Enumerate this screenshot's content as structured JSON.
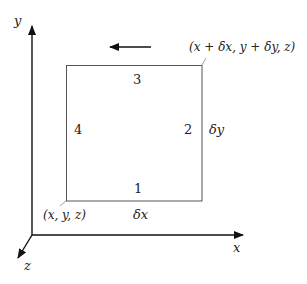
{
  "diagram": {
    "axes": {
      "x_label": "x",
      "y_label": "y",
      "z_label": "z"
    },
    "square": {
      "sides": [
        {
          "id": "1",
          "label": "1",
          "position": "bottom"
        },
        {
          "id": "2",
          "label": "2",
          "position": "right"
        },
        {
          "id": "3",
          "label": "3",
          "position": "top"
        },
        {
          "id": "4",
          "label": "4",
          "position": "left"
        }
      ],
      "width_label": "δx",
      "height_label": "δy",
      "corner_bottom_left": "(x, y, z)",
      "corner_top_right": "(x + δx, y + δy, z)"
    },
    "circulation_arrow": {
      "direction": "left"
    },
    "colors": {
      "axis": "#111111",
      "square": "#555555",
      "text": "#222222"
    }
  }
}
